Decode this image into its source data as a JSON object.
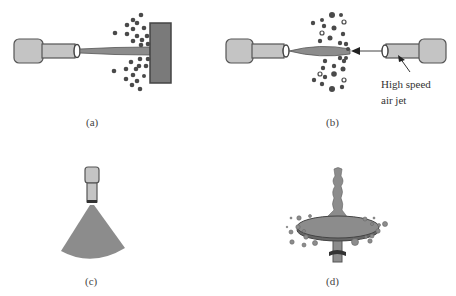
{
  "figure": {
    "panels": [
      {
        "id": "a",
        "label": "(a)",
        "description": "Nozzle spraying liquid jet onto a flat impact plate, producing droplets"
      },
      {
        "id": "b",
        "label": "(b)",
        "description": "Liquid jet from nozzle broken up by opposing high speed air jet"
      },
      {
        "id": "c",
        "label": "(c)",
        "description": "Nozzle producing a fan-shaped spray"
      },
      {
        "id": "d",
        "label": "(d)",
        "description": "Liquid stream onto a spinning disc flinging droplets outward"
      }
    ],
    "annotation": {
      "line1": "High speed",
      "line2": "air jet"
    }
  },
  "colors": {
    "background": "#ffffff",
    "nozzle_fill": "#c4c4c4",
    "outline": "#555555",
    "liquid_fill": "#8c8c8c",
    "plate_fill": "#7a7a7a",
    "droplet_fill": "#4a4a4a",
    "text": "#333333"
  }
}
